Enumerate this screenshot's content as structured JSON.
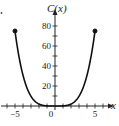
{
  "chart_data": {
    "type": "line",
    "title": "",
    "xlabel": "x",
    "ylabel": "C(x)",
    "xlim": [
      -6.5,
      6.5
    ],
    "ylim": [
      0,
      90
    ],
    "x_ticks": [
      -6,
      -5,
      -4,
      -3,
      -2,
      -1,
      0,
      1,
      2,
      3,
      4,
      5,
      6
    ],
    "x_tick_labels": [
      {
        "value": -5,
        "label": "−5"
      },
      {
        "value": 0,
        "label": "0"
      },
      {
        "value": 5,
        "label": "5"
      }
    ],
    "y_ticks": [
      10,
      20,
      30,
      40,
      50,
      60,
      70,
      80
    ],
    "y_tick_labels": [
      {
        "value": 20,
        "label": "20"
      },
      {
        "value": 40,
        "label": "40"
      },
      {
        "value": 60,
        "label": "60"
      },
      {
        "value": 80,
        "label": "80"
      }
    ],
    "grid": false,
    "series": [
      {
        "name": "C(x)",
        "function": "0.12 * x^4",
        "domain": [
          -5,
          5
        ],
        "endpoints": [
          {
            "x": -5,
            "y": 75,
            "filled": true
          },
          {
            "x": 5,
            "y": 75,
            "filled": true
          }
        ]
      }
    ]
  }
}
